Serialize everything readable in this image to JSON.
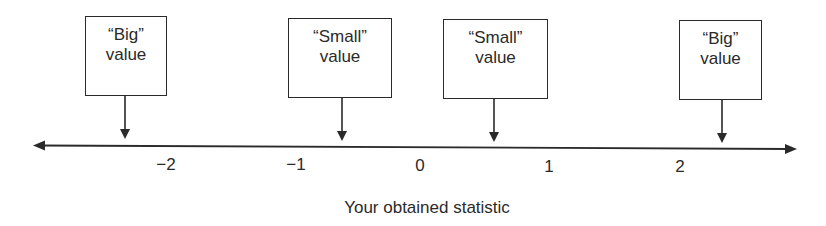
{
  "diagram": {
    "axis_title": "Your obtained statistic",
    "ticks": [
      {
        "label": "−2",
        "x": 166
      },
      {
        "label": "−1",
        "x": 296
      },
      {
        "label": "0",
        "x": 420
      },
      {
        "label": "1",
        "x": 549
      },
      {
        "label": "2",
        "x": 680
      }
    ],
    "boxes": [
      {
        "line1": "“Big”",
        "line2": "value",
        "left": 85,
        "top": 16,
        "width": 82,
        "height": 80,
        "arrow_x": 125
      },
      {
        "line1": "“Small”",
        "line2": "value",
        "left": 288,
        "top": 18,
        "width": 104,
        "height": 80,
        "arrow_x": 342
      },
      {
        "line1": "“Small”",
        "line2": "value",
        "left": 443,
        "top": 19,
        "width": 105,
        "height": 80,
        "arrow_x": 494
      },
      {
        "line1": "“Big”",
        "line2": "value",
        "left": 679,
        "top": 20,
        "width": 83,
        "height": 80,
        "arrow_x": 722
      }
    ],
    "colors": {
      "ink": "#2a2a2a",
      "background": "#ffffff"
    }
  }
}
